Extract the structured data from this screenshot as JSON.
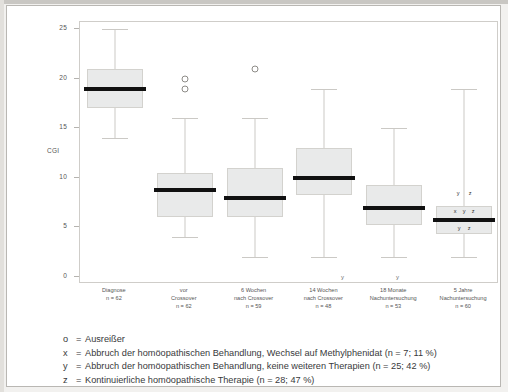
{
  "chart_data": {
    "type": "box",
    "title": "",
    "xlabel": "",
    "ylabel": "CGI",
    "ylim": [
      0,
      25
    ],
    "yticks": [
      0,
      5,
      10,
      15,
      20,
      25
    ],
    "ytick_labels": [
      "0",
      "5",
      "10",
      "15",
      "20",
      "25"
    ],
    "grid": false,
    "legend_position": "below-axis",
    "categories": [
      {
        "line1": "Diagnose",
        "line2": "",
        "line3": "n = 62"
      },
      {
        "line1": "vor",
        "line2": "Crossover",
        "line3": "n = 62"
      },
      {
        "line1": "6 Wochen",
        "line2": "nach Crossover",
        "line3": "n = 59"
      },
      {
        "line1": "14 Wochen",
        "line2": "nach Crossover",
        "line3": "n = 48"
      },
      {
        "line1": "18 Monate",
        "line2": "Nachuntersuchung",
        "line3": "n = 53"
      },
      {
        "line1": "5 Jahre",
        "line2": "Nachuntersuchung",
        "line3": "n = 60"
      }
    ],
    "boxes": [
      {
        "name": "Diagnose",
        "whisker_low": 14.0,
        "q1": 17.0,
        "median": 19.0,
        "q3": 21.0,
        "whisker_high": 25.0,
        "outliers": []
      },
      {
        "name": "vor Crossover",
        "whisker_low": 4.0,
        "q1": 6.0,
        "median": 8.8,
        "q3": 10.5,
        "whisker_high": 16.0,
        "outliers": [
          20.0,
          19.0
        ]
      },
      {
        "name": "6 Wochen nach Crossover",
        "whisker_low": 2.0,
        "q1": 6.0,
        "median": 8.0,
        "q3": 11.0,
        "whisker_high": 16.0,
        "outliers": [
          21.0
        ]
      },
      {
        "name": "14 Wochen nach Crossover",
        "whisker_low": 2.0,
        "q1": 8.3,
        "median": 10.0,
        "q3": 13.0,
        "whisker_high": 19.0,
        "outliers": []
      },
      {
        "name": "18 Monate Nachuntersuchung",
        "whisker_low": 2.0,
        "q1": 5.2,
        "median": 7.0,
        "q3": 9.3,
        "whisker_high": 15.0,
        "outliers": []
      },
      {
        "name": "5 Jahre Nachuntersuchung",
        "whisker_low": 2.0,
        "q1": 4.3,
        "median": 5.7,
        "q3": 7.2,
        "whisker_high": 19.0,
        "outliers": []
      }
    ],
    "annotations": {
      "in_box_markers": [
        "x",
        "y",
        "z"
      ],
      "above_box_markers": [
        "y",
        "z"
      ],
      "axis_markers": [
        "y",
        "y"
      ]
    },
    "colors": {
      "box_fill": "#e9eaea",
      "box_border": "#d3d2ce",
      "median": "#111111",
      "whisker": "#cbc9c5",
      "frame": "#cfcdc9",
      "text": "#555555"
    }
  },
  "footnotes": [
    {
      "key": "o",
      "eq": "=",
      "text": "Ausreißer"
    },
    {
      "key": "x",
      "eq": "=",
      "text": "Abbruch der homöopathischen Behandlung, Wechsel auf Methylphenidat (n = 7; 11 %)"
    },
    {
      "key": "y",
      "eq": "=",
      "text": "Abbruch der homöopathischen Behandlung, keine weiteren Therapien (n = 25; 42 %)"
    },
    {
      "key": "z",
      "eq": "=",
      "text": "Kontinuierliche homöopathische Therapie (n = 28; 47 %)"
    }
  ]
}
